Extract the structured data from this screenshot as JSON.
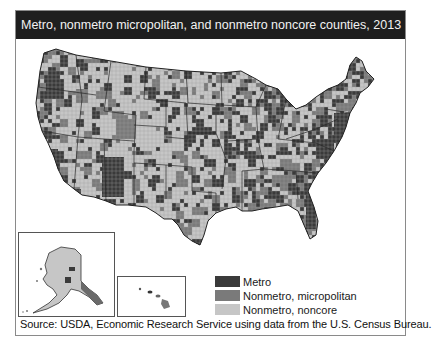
{
  "title": "Metro, nonmetro micropolitan, and nonmetro noncore counties, 2013",
  "legend": [
    {
      "label": "Metro",
      "color": "#3a3a3a"
    },
    {
      "label": "Nonmetro, micropolitan",
      "color": "#7a7a7a"
    },
    {
      "label": "Nonmetro, noncore",
      "color": "#c6c6c6"
    }
  ],
  "insets": {
    "alaska": "Alaska",
    "hawaii": "Hawaii"
  },
  "source": "Source: USDA, Economic Research Service using data from the U.S. Census Bureau.",
  "colors": {
    "title_bg": "#1e1e1e",
    "border": "#444444",
    "water": "#ffffff"
  }
}
